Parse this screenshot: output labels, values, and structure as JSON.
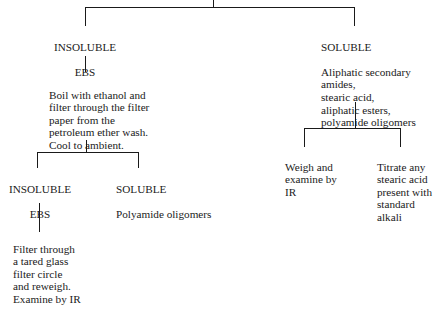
{
  "diagram": {
    "type": "flowchart-tree",
    "nodes": {
      "insoluble_ebs_top": {
        "heading": "INSOLUBLE",
        "text": "EBS"
      },
      "soluble_top": {
        "heading": "SOLUBLE",
        "text": "Aliphatic secondary\namides,\nstearic acid,\naliphatic esters,\npolyamide oligomers"
      },
      "boil_step": {
        "text": "Boil with ethanol and\nfilter through the filter\npaper from the\npetroleum ether wash.\nCool to ambient."
      },
      "insoluble_ebs_bottom": {
        "heading": "INSOLUBLE",
        "text": "EBS"
      },
      "soluble_bottom": {
        "heading": "SOLUBLE",
        "text": "Polyamide oligomers"
      },
      "filter_step": {
        "text": "Filter through\na tared glass\nfilter circle\nand reweigh.\nExamine by IR"
      },
      "weigh_step": {
        "text": "Weigh and\nexamine by\nIR"
      },
      "titrate_step": {
        "text": "Titrate any\nstearic acid\npresent with\nstandard\nalkali"
      }
    },
    "edges": [
      [
        "root",
        "insoluble_ebs_top"
      ],
      [
        "root",
        "soluble_top"
      ],
      [
        "insoluble_ebs_top",
        "boil_step"
      ],
      [
        "boil_step",
        "insoluble_ebs_bottom"
      ],
      [
        "boil_step",
        "soluble_bottom"
      ],
      [
        "insoluble_ebs_bottom",
        "filter_step"
      ],
      [
        "soluble_top",
        "weigh_step"
      ],
      [
        "soluble_top",
        "titrate_step"
      ]
    ]
  }
}
